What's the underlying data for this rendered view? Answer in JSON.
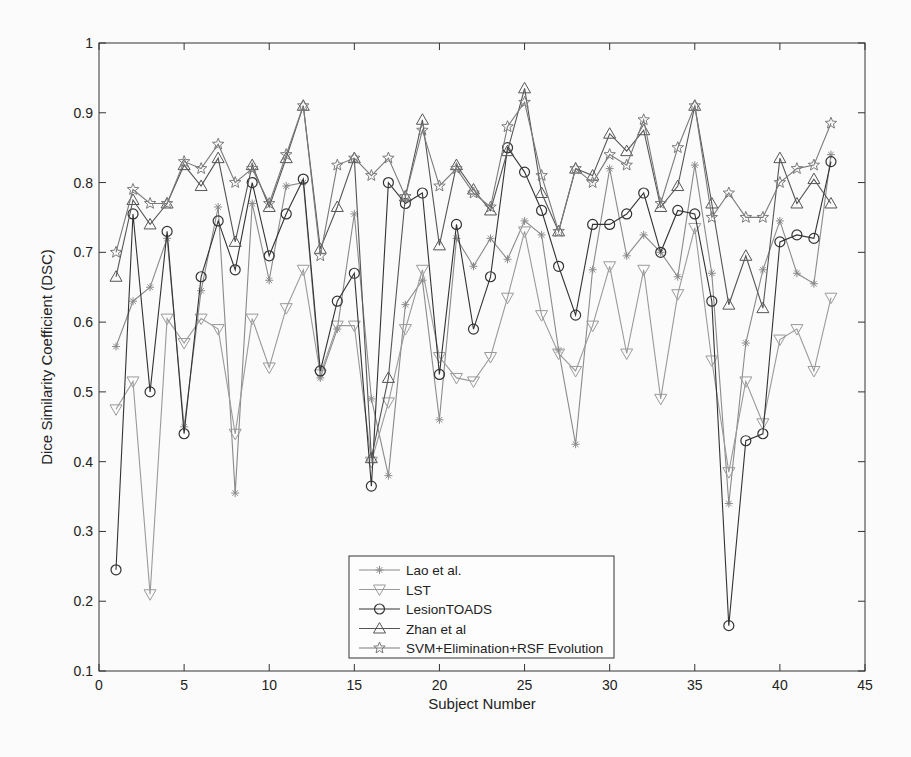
{
  "chart_data": {
    "type": "line",
    "title": "",
    "xlabel": "Subject Number",
    "ylabel": "Dice Similarity Coefficient (DSC)",
    "xlim": [
      0,
      45
    ],
    "ylim": [
      0.1,
      1
    ],
    "xticks": [
      0,
      5,
      10,
      15,
      20,
      25,
      30,
      35,
      40,
      45
    ],
    "yticks": [
      0.1,
      0.2,
      0.3,
      0.4,
      0.5,
      0.6,
      0.7,
      0.8,
      0.9,
      1
    ],
    "ytick_labels": [
      "0.1",
      "0.2",
      "0.3",
      "0.4",
      "0.5",
      "0.6",
      "0.7",
      "0.8",
      "0.9",
      "1"
    ],
    "grid": false,
    "legend_position": "lower center",
    "x": [
      1,
      2,
      3,
      4,
      5,
      6,
      7,
      8,
      9,
      10,
      11,
      12,
      13,
      14,
      15,
      16,
      17,
      18,
      19,
      20,
      21,
      22,
      23,
      24,
      25,
      26,
      27,
      28,
      29,
      30,
      31,
      32,
      33,
      34,
      35,
      36,
      37,
      38,
      39,
      40,
      41,
      42,
      43
    ],
    "series": [
      {
        "name": "Lao et al.",
        "marker": "asterisk",
        "color": "#8a8a8a",
        "values": [
          0.565,
          0.63,
          0.65,
          0.72,
          0.45,
          0.645,
          0.765,
          0.355,
          0.77,
          0.66,
          0.795,
          0.8,
          0.52,
          0.59,
          0.755,
          0.49,
          0.38,
          0.625,
          0.66,
          0.46,
          0.72,
          0.68,
          0.72,
          0.69,
          0.745,
          0.725,
          0.56,
          0.425,
          0.675,
          0.82,
          0.695,
          0.725,
          0.7,
          0.665,
          0.825,
          0.67,
          0.34,
          0.57,
          0.675,
          0.745,
          0.67,
          0.655,
          0.84
        ]
      },
      {
        "name": "LST",
        "marker": "triangle-down",
        "color": "#9a9a9a",
        "values": [
          0.475,
          0.515,
          0.21,
          0.605,
          0.57,
          0.605,
          0.59,
          0.44,
          0.605,
          0.535,
          0.62,
          0.675,
          0.525,
          0.595,
          0.595,
          0.4,
          0.485,
          0.59,
          0.675,
          0.55,
          0.52,
          0.515,
          0.55,
          0.635,
          0.73,
          0.61,
          0.555,
          0.53,
          0.595,
          0.68,
          0.555,
          0.675,
          0.49,
          0.64,
          0.735,
          0.545,
          0.385,
          0.515,
          0.455,
          0.575,
          0.59,
          0.53,
          0.635
        ]
      },
      {
        "name": "LesionTOADS",
        "marker": "circle",
        "color": "#333333",
        "values": [
          0.245,
          0.755,
          0.5,
          0.73,
          0.44,
          0.665,
          0.745,
          0.675,
          0.8,
          0.695,
          0.755,
          0.805,
          0.53,
          0.63,
          0.67,
          0.365,
          0.8,
          0.77,
          0.785,
          0.525,
          0.74,
          0.59,
          0.665,
          0.85,
          0.815,
          0.76,
          0.68,
          0.61,
          0.74,
          0.74,
          0.755,
          0.785,
          0.7,
          0.76,
          0.755,
          0.63,
          0.165,
          0.43,
          0.44,
          0.715,
          0.725,
          0.72,
          0.83
        ]
      },
      {
        "name": "Zhan et al",
        "marker": "triangle-up",
        "color": "#555555",
        "values": [
          0.665,
          0.775,
          0.74,
          0.77,
          0.825,
          0.795,
          0.835,
          0.715,
          0.825,
          0.765,
          0.835,
          0.91,
          0.705,
          0.765,
          0.835,
          0.405,
          0.52,
          0.78,
          0.89,
          0.71,
          0.825,
          0.79,
          0.76,
          0.845,
          0.935,
          0.785,
          0.73,
          0.82,
          0.81,
          0.87,
          0.845,
          0.875,
          0.765,
          0.795,
          0.91,
          0.77,
          0.625,
          0.695,
          0.62,
          0.835,
          0.77,
          0.805,
          0.77
        ]
      },
      {
        "name": "SVM+Elimination+RSF Evolution",
        "marker": "star",
        "color": "#7a7a7a",
        "values": [
          0.7,
          0.79,
          0.77,
          0.77,
          0.83,
          0.82,
          0.855,
          0.8,
          0.82,
          0.77,
          0.84,
          0.91,
          0.695,
          0.825,
          0.835,
          0.81,
          0.835,
          0.78,
          0.875,
          0.795,
          0.82,
          0.785,
          0.765,
          0.88,
          0.915,
          0.81,
          0.73,
          0.82,
          0.8,
          0.84,
          0.825,
          0.89,
          0.77,
          0.85,
          0.91,
          0.75,
          0.785,
          0.75,
          0.75,
          0.8,
          0.82,
          0.825,
          0.885
        ]
      }
    ]
  },
  "axes": {
    "x_label": "Subject Number",
    "y_label": "Dice Similarity Coefficient (DSC)"
  },
  "legend": {
    "items": [
      "Lao et al.",
      "LST",
      "LesionTOADS",
      "Zhan et al",
      "SVM+Elimination+RSF Evolution"
    ]
  }
}
